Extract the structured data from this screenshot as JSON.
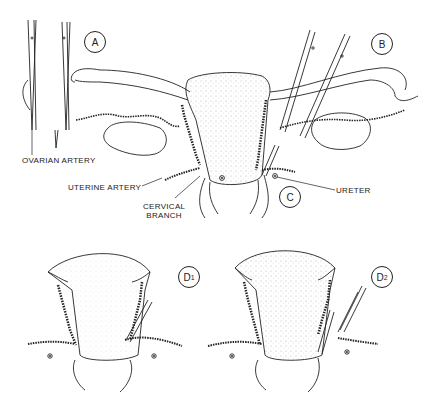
{
  "figure": {
    "panels": [
      {
        "id": "A",
        "label": "A"
      },
      {
        "id": "B",
        "label": "B"
      },
      {
        "id": "C",
        "label": "C"
      },
      {
        "id": "D1",
        "label": "D",
        "subscript": "1"
      },
      {
        "id": "D2",
        "label": "D",
        "subscript": "2"
      }
    ],
    "annotations": {
      "ovarian_artery": "OVARIAN ARTERY",
      "uterine_artery": "UTERINE ARTERY",
      "cervical_branch_line1": "CERVICAL",
      "cervical_branch_line2": "BRANCH",
      "ureter": "URETER"
    }
  },
  "colors": {
    "ink": "#222222",
    "stipple": "#555555",
    "background": "#ffffff"
  }
}
